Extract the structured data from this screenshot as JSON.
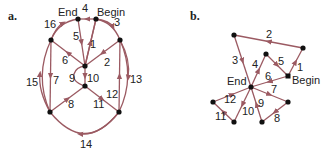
{
  "figure": {
    "panels": [
      {
        "id": "a",
        "panel_label": "a.",
        "begin_label": "Begin",
        "end_label": "End",
        "edge_labels": [
          "1",
          "2",
          "3",
          "4",
          "5",
          "6",
          "7",
          "8",
          "9",
          "10",
          "11",
          "12",
          "13",
          "14",
          "15",
          "16"
        ]
      },
      {
        "id": "b",
        "panel_label": "b.",
        "begin_label": "Begin",
        "end_label": "End",
        "edge_labels": [
          "1",
          "2",
          "3",
          "4",
          "5",
          "6",
          "7",
          "8",
          "9",
          "10",
          "11",
          "12"
        ]
      }
    ],
    "colors": {
      "edge": "#9b5a62",
      "node": "#111111",
      "text": "#222222"
    }
  }
}
